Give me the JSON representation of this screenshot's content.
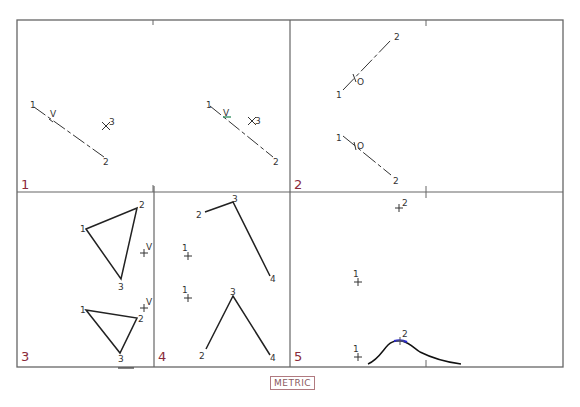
{
  "panels": [
    {
      "id": "1",
      "label": "1"
    },
    {
      "id": "2",
      "label": "2"
    },
    {
      "id": "3",
      "label": "3"
    },
    {
      "id": "4",
      "label": "4"
    },
    {
      "id": "5",
      "label": "5"
    }
  ],
  "points": {
    "p1a": {
      "one": "1",
      "v": "V",
      "two": "2",
      "three": "3"
    },
    "p1b": {
      "one": "1",
      "v": "V",
      "two": "2",
      "three": "3"
    },
    "p2a": {
      "one": "1",
      "o": "O",
      "two": "2"
    },
    "p2b": {
      "one": "1",
      "o": "O",
      "two": "2"
    },
    "p3a": {
      "one": "1",
      "two": "2",
      "three": "3",
      "v": "V"
    },
    "p3b": {
      "one": "1",
      "two": "2",
      "three": "3",
      "v": "V"
    },
    "p4a": {
      "one": "1",
      "two": "2",
      "three": "3",
      "four": "4"
    },
    "p4b": {
      "one": "1",
      "two": "2",
      "three": "3",
      "four": "4"
    },
    "p5": {
      "two_top": "2",
      "one_mid": "1",
      "one_bot": "1",
      "two_bot": "2"
    }
  },
  "footer": {
    "units_label": "METRIC"
  },
  "colors": {
    "frame": "#555555",
    "panel_number": "#8a2a3a",
    "highlight": "#2a2ad0"
  }
}
